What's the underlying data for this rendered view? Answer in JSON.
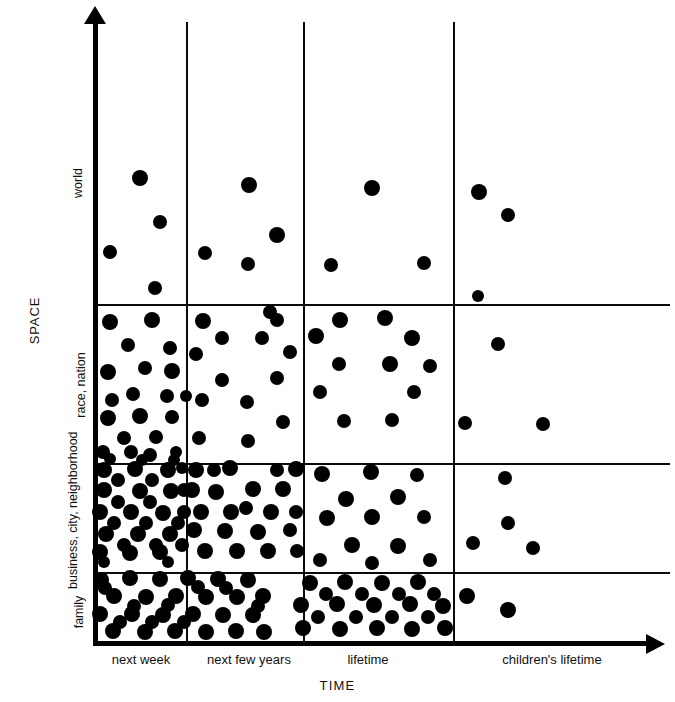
{
  "chart_data": {
    "type": "scatter",
    "title": "",
    "subtitle": "",
    "xlabel": "TIME",
    "ylabel": "SPACE",
    "grid": true,
    "legend": "none",
    "x_categories": [
      "next week",
      "next few years",
      "lifetime",
      "children's lifetime"
    ],
    "y_categories": [
      "family",
      "business, city, neighborhood",
      "race, nation",
      "world"
    ],
    "x_boundaries_px": [
      96,
      186,
      303,
      453,
      670
    ],
    "y_boundaries_px": [
      8,
      304,
      463,
      572,
      645
    ],
    "cell_counts": [
      {
        "space": "world",
        "time": "next week",
        "count": 4
      },
      {
        "space": "world",
        "time": "next few years",
        "count": 4
      },
      {
        "space": "world",
        "time": "lifetime",
        "count": 2
      },
      {
        "space": "world",
        "time": "children's lifetime",
        "count": 3
      },
      {
        "space": "race, nation",
        "time": "next week",
        "count": 20
      },
      {
        "space": "race, nation",
        "time": "next few years",
        "count": 13
      },
      {
        "space": "race, nation",
        "time": "lifetime",
        "count": 11
      },
      {
        "space": "race, nation",
        "time": "children's lifetime",
        "count": 3
      },
      {
        "space": "business, city, neighborhood",
        "time": "next week",
        "count": 30
      },
      {
        "space": "business, city, neighborhood",
        "time": "next few years",
        "count": 23
      },
      {
        "space": "business, city, neighborhood",
        "time": "lifetime",
        "count": 13
      },
      {
        "space": "business, city, neighborhood",
        "time": "children's lifetime",
        "count": 4
      },
      {
        "space": "family",
        "time": "next week",
        "count": 33
      },
      {
        "space": "family",
        "time": "next few years",
        "count": 22
      },
      {
        "space": "family",
        "time": "lifetime",
        "count": 9
      },
      {
        "space": "family",
        "time": "children's lifetime",
        "count": 2
      }
    ],
    "points": [
      [
        140,
        178,
        8
      ],
      [
        110,
        252,
        7
      ],
      [
        160,
        222,
        7
      ],
      [
        155,
        288,
        7
      ],
      [
        249,
        185,
        8
      ],
      [
        277,
        235,
        8
      ],
      [
        205,
        253,
        7
      ],
      [
        248,
        264,
        7
      ],
      [
        270,
        312,
        7
      ],
      [
        372,
        188,
        8
      ],
      [
        331,
        265,
        7
      ],
      [
        424,
        263,
        7
      ],
      [
        479,
        192,
        8
      ],
      [
        508,
        215,
        7
      ],
      [
        478,
        296,
        6
      ],
      [
        110,
        322,
        8
      ],
      [
        152,
        320,
        8
      ],
      [
        128,
        345,
        7
      ],
      [
        170,
        348,
        7
      ],
      [
        108,
        372,
        8
      ],
      [
        172,
        371,
        8
      ],
      [
        133,
        394,
        7
      ],
      [
        167,
        396,
        7
      ],
      [
        108,
        418,
        8
      ],
      [
        140,
        416,
        8
      ],
      [
        172,
        417,
        7
      ],
      [
        124,
        438,
        7
      ],
      [
        156,
        437,
        7
      ],
      [
        103,
        452,
        7
      ],
      [
        131,
        452,
        7
      ],
      [
        150,
        455,
        7
      ],
      [
        176,
        452,
        6
      ],
      [
        112,
        400,
        7
      ],
      [
        145,
        368,
        7
      ],
      [
        186,
        396,
        6
      ],
      [
        203,
        321,
        8
      ],
      [
        277,
        320,
        7
      ],
      [
        222,
        338,
        7
      ],
      [
        262,
        338,
        7
      ],
      [
        196,
        354,
        7
      ],
      [
        290,
        352,
        7
      ],
      [
        222,
        380,
        7
      ],
      [
        277,
        378,
        7
      ],
      [
        202,
        400,
        7
      ],
      [
        247,
        402,
        7
      ],
      [
        283,
        422,
        7
      ],
      [
        199,
        438,
        7
      ],
      [
        248,
        441,
        7
      ],
      [
        340,
        320,
        8
      ],
      [
        385,
        318,
        8
      ],
      [
        316,
        336,
        8
      ],
      [
        412,
        338,
        8
      ],
      [
        339,
        364,
        7
      ],
      [
        390,
        364,
        8
      ],
      [
        430,
        366,
        7
      ],
      [
        320,
        392,
        7
      ],
      [
        414,
        392,
        7
      ],
      [
        344,
        421,
        7
      ],
      [
        392,
        420,
        7
      ],
      [
        498,
        344,
        7
      ],
      [
        465,
        423,
        7
      ],
      [
        543,
        424,
        7
      ],
      [
        104,
        470,
        8
      ],
      [
        135,
        469,
        8
      ],
      [
        168,
        470,
        8
      ],
      [
        104,
        490,
        8
      ],
      [
        140,
        491,
        8
      ],
      [
        171,
        491,
        8
      ],
      [
        100,
        512,
        8
      ],
      [
        131,
        512,
        8
      ],
      [
        163,
        513,
        8
      ],
      [
        184,
        490,
        7
      ],
      [
        184,
        512,
        7
      ],
      [
        106,
        534,
        8
      ],
      [
        138,
        534,
        8
      ],
      [
        170,
        534,
        8
      ],
      [
        118,
        480,
        7
      ],
      [
        152,
        480,
        7
      ],
      [
        118,
        502,
        7
      ],
      [
        150,
        502,
        7
      ],
      [
        182,
        468,
        6
      ],
      [
        100,
        552,
        8
      ],
      [
        130,
        553,
        8
      ],
      [
        160,
        552,
        8
      ],
      [
        114,
        523,
        7
      ],
      [
        146,
        523,
        7
      ],
      [
        178,
        523,
        7
      ],
      [
        182,
        545,
        7
      ],
      [
        124,
        545,
        7
      ],
      [
        156,
        545,
        7
      ],
      [
        110,
        459,
        6
      ],
      [
        142,
        460,
        6
      ],
      [
        174,
        460,
        6
      ],
      [
        104,
        562,
        6
      ],
      [
        168,
        562,
        6
      ],
      [
        196,
        470,
        8
      ],
      [
        230,
        468,
        8
      ],
      [
        296,
        469,
        8
      ],
      [
        192,
        490,
        8
      ],
      [
        216,
        492,
        8
      ],
      [
        253,
        489,
        8
      ],
      [
        283,
        489,
        8
      ],
      [
        201,
        512,
        8
      ],
      [
        231,
        512,
        8
      ],
      [
        271,
        512,
        8
      ],
      [
        296,
        512,
        7
      ],
      [
        194,
        530,
        8
      ],
      [
        225,
        531,
        8
      ],
      [
        258,
        532,
        8
      ],
      [
        290,
        530,
        7
      ],
      [
        205,
        551,
        8
      ],
      [
        237,
        551,
        8
      ],
      [
        268,
        551,
        8
      ],
      [
        297,
        551,
        7
      ],
      [
        214,
        470,
        7
      ],
      [
        246,
        508,
        7
      ],
      [
        277,
        470,
        7
      ],
      [
        322,
        474,
        8
      ],
      [
        371,
        472,
        8
      ],
      [
        417,
        475,
        7
      ],
      [
        346,
        499,
        8
      ],
      [
        398,
        497,
        8
      ],
      [
        327,
        518,
        8
      ],
      [
        372,
        517,
        8
      ],
      [
        424,
        517,
        7
      ],
      [
        352,
        545,
        8
      ],
      [
        398,
        546,
        8
      ],
      [
        320,
        560,
        7
      ],
      [
        372,
        563,
        7
      ],
      [
        430,
        560,
        7
      ],
      [
        505,
        478,
        7
      ],
      [
        508,
        523,
        7
      ],
      [
        473,
        543,
        7
      ],
      [
        533,
        548,
        7
      ],
      [
        101,
        580,
        8
      ],
      [
        130,
        578,
        8
      ],
      [
        160,
        579,
        8
      ],
      [
        188,
        578,
        8
      ],
      [
        218,
        579,
        8
      ],
      [
        248,
        580,
        8
      ],
      [
        114,
        596,
        8
      ],
      [
        146,
        597,
        8
      ],
      [
        176,
        596,
        8
      ],
      [
        206,
        597,
        8
      ],
      [
        237,
        597,
        8
      ],
      [
        263,
        596,
        8
      ],
      [
        100,
        614,
        8
      ],
      [
        132,
        614,
        8
      ],
      [
        163,
        615,
        8
      ],
      [
        193,
        614,
        8
      ],
      [
        223,
        615,
        8
      ],
      [
        253,
        615,
        8
      ],
      [
        113,
        631,
        8
      ],
      [
        145,
        632,
        8
      ],
      [
        175,
        631,
        8
      ],
      [
        206,
        632,
        8
      ],
      [
        236,
        631,
        8
      ],
      [
        264,
        632,
        8
      ],
      [
        105,
        588,
        7
      ],
      [
        134,
        606,
        7
      ],
      [
        168,
        605,
        7
      ],
      [
        198,
        587,
        7
      ],
      [
        226,
        588,
        7
      ],
      [
        258,
        606,
        7
      ],
      [
        120,
        622,
        7
      ],
      [
        152,
        622,
        7
      ],
      [
        184,
        622,
        7
      ],
      [
        310,
        583,
        8
      ],
      [
        345,
        582,
        8
      ],
      [
        382,
        583,
        8
      ],
      [
        418,
        582,
        8
      ],
      [
        301,
        605,
        8
      ],
      [
        337,
        604,
        8
      ],
      [
        374,
        605,
        8
      ],
      [
        410,
        604,
        8
      ],
      [
        443,
        606,
        8
      ],
      [
        303,
        628,
        8
      ],
      [
        340,
        629,
        8
      ],
      [
        377,
        628,
        8
      ],
      [
        412,
        629,
        8
      ],
      [
        445,
        628,
        8
      ],
      [
        326,
        594,
        7
      ],
      [
        362,
        594,
        7
      ],
      [
        399,
        594,
        7
      ],
      [
        434,
        594,
        7
      ],
      [
        318,
        617,
        7
      ],
      [
        356,
        617,
        7
      ],
      [
        392,
        617,
        7
      ],
      [
        428,
        617,
        7
      ],
      [
        467,
        596,
        8
      ],
      [
        508,
        610,
        8
      ]
    ]
  },
  "yaxis": {
    "title": "SPACE",
    "ticks": [
      {
        "label": "world",
        "top_px": 8,
        "bottom_px": 304
      },
      {
        "label": "race, nation",
        "top_px": 304,
        "bottom_px": 463
      },
      {
        "label": "business, city, neighborhood",
        "top_px": 463,
        "bottom_px": 572
      },
      {
        "label": "family",
        "top_px": 572,
        "bottom_px": 645
      }
    ]
  },
  "xaxis": {
    "title": "TIME",
    "ticks": [
      {
        "label": "next week",
        "left_px": 96,
        "right_px": 186
      },
      {
        "label": "next few years",
        "left_px": 186,
        "right_px": 303
      },
      {
        "label": "lifetime",
        "left_px": 303,
        "right_px": 453
      },
      {
        "label": "children's lifetime",
        "left_px": 453,
        "right_px": 670
      }
    ]
  },
  "style": {
    "dot_color": "#000000",
    "line_color": "#0a0a0a",
    "background": "#ffffff"
  }
}
